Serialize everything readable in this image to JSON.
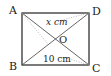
{
  "diagram": {
    "type": "rectangle-with-diagonals",
    "vertices": {
      "A": "A",
      "B": "B",
      "C": "C",
      "D": "D"
    },
    "center": "O",
    "labels": {
      "top_segment": "x cm",
      "bottom_segment": "10 cm"
    },
    "colors": {
      "stroke": "#222222",
      "dotted": "#aaaaaa",
      "background": "#ffffff"
    }
  }
}
